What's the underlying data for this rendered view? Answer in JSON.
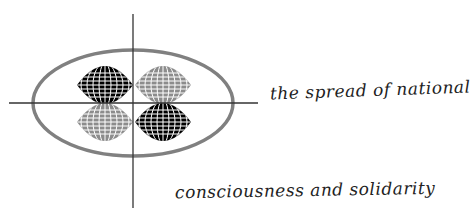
{
  "caption": {
    "line1": "the spread of national",
    "line2": "consciousness and solidarity"
  },
  "diagram": {
    "axes": {
      "vertical": {
        "x": 133,
        "y1": 14,
        "y2": 208
      },
      "horizontal": {
        "y": 103,
        "x1": 9,
        "x2": 258
      },
      "color": "#333333"
    },
    "ellipse": {
      "cx": 133,
      "cy": 103,
      "rx": 100,
      "ry": 53,
      "color": "#808080"
    },
    "globes": [
      {
        "position": "top-left",
        "fill": "#000000"
      },
      {
        "position": "top-right",
        "fill": "#8c8c8c"
      },
      {
        "position": "bottom-left",
        "fill": "#8c8c8c"
      },
      {
        "position": "bottom-right",
        "fill": "#000000"
      }
    ]
  }
}
